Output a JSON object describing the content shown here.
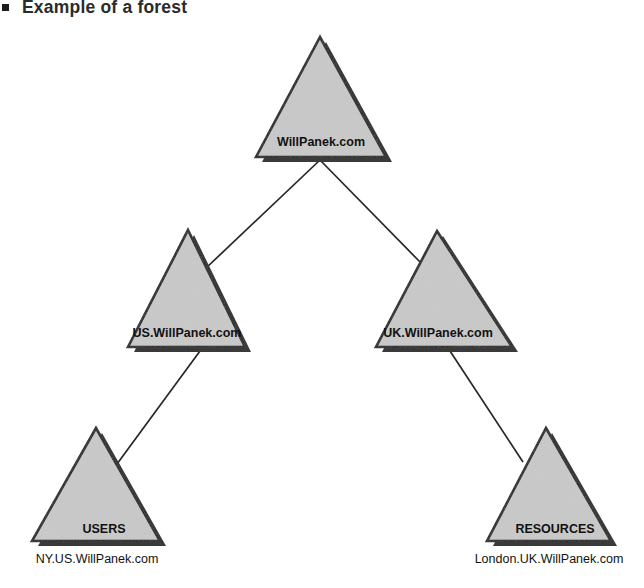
{
  "heading": {
    "bullet": "square-bullet",
    "text": "Example of a forest"
  },
  "diagram": {
    "type": "hierarchy-tree",
    "shape": "triangle",
    "colors": {
      "fill": "#c9c9c9",
      "outline": "#1a1a1a",
      "shadow": "#3a3a3a",
      "connector": "#262626",
      "text": "#121212",
      "background": "#ffffff"
    },
    "nodes": [
      {
        "id": "root",
        "label": "WillPanek.com",
        "caption": "",
        "level": 0,
        "apex": {
          "x": 320,
          "y": 37
        },
        "base_left": {
          "x": 256,
          "y": 157
        },
        "base_right": {
          "x": 386,
          "y": 157
        }
      },
      {
        "id": "us",
        "label": "US.WillPanek.com",
        "caption": "",
        "level": 1,
        "apex": {
          "x": 188,
          "y": 230
        },
        "base_left": {
          "x": 128,
          "y": 347
        },
        "base_right": {
          "x": 245,
          "y": 347
        }
      },
      {
        "id": "uk",
        "label": "UK.WillPanek.com",
        "caption": "",
        "level": 1,
        "apex": {
          "x": 437,
          "y": 231
        },
        "base_left": {
          "x": 376,
          "y": 347
        },
        "base_right": {
          "x": 512,
          "y": 347
        }
      },
      {
        "id": "users",
        "label": "USERS",
        "caption": "NY.US.WillPanek.com",
        "level": 2,
        "apex": {
          "x": 96,
          "y": 428
        },
        "base_left": {
          "x": 32,
          "y": 541
        },
        "base_right": {
          "x": 160,
          "y": 541
        }
      },
      {
        "id": "resources",
        "label": "RESOURCES",
        "caption": "London.UK.WillPanek.com",
        "level": 2,
        "apex": {
          "x": 546,
          "y": 428
        },
        "base_left": {
          "x": 487,
          "y": 541
        },
        "base_right": {
          "x": 611,
          "y": 541
        }
      }
    ],
    "edges": [
      {
        "id": "root-us",
        "from": "root",
        "to": "us",
        "x1": 320,
        "y1": 160,
        "x2": 205,
        "y2": 269
      },
      {
        "id": "root-uk",
        "from": "root",
        "to": "uk",
        "x1": 320,
        "y1": 160,
        "x2": 421,
        "y2": 263
      },
      {
        "id": "us-users",
        "from": "us",
        "to": "users",
        "x1": 200,
        "y1": 351,
        "x2": 117,
        "y2": 464
      },
      {
        "id": "uk-resources",
        "from": "uk",
        "to": "resources",
        "x1": 450,
        "y1": 351,
        "x2": 523,
        "y2": 462
      }
    ]
  }
}
